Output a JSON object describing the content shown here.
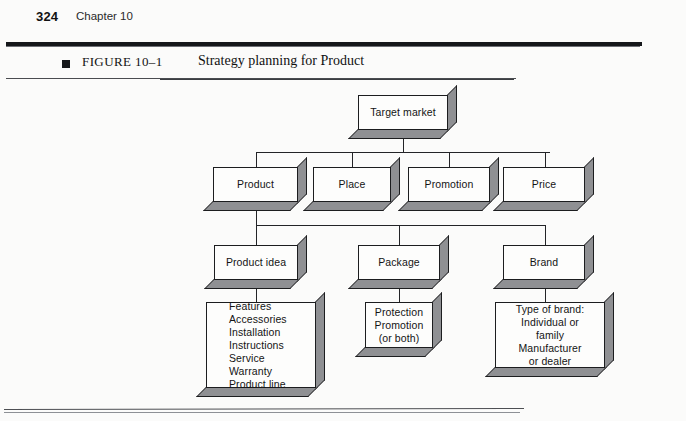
{
  "page": {
    "number": "324",
    "chapter": "Chapter 10",
    "background_color": "#fbfbfa",
    "rule_color": "#15171a"
  },
  "figure": {
    "bullet": "square-bullet-icon",
    "number": "FIGURE 10–1",
    "title": "Strategy planning for Product"
  },
  "diagram": {
    "type": "hierarchy-tree",
    "box_face_color": "#fdfdfc",
    "box_shadow_color": "#8f9093",
    "box_outline_color": "#1c1d1f",
    "levels": [
      {
        "level": 1,
        "nodes": [
          {
            "id": "target-market",
            "label": "Target market"
          }
        ]
      },
      {
        "level": 2,
        "nodes": [
          {
            "id": "product",
            "label": "Product"
          },
          {
            "id": "place",
            "label": "Place"
          },
          {
            "id": "promotion",
            "label": "Promotion"
          },
          {
            "id": "price",
            "label": "Price"
          }
        ]
      },
      {
        "level": 3,
        "nodes": [
          {
            "id": "product-idea",
            "label": "Product idea"
          },
          {
            "id": "package",
            "label": "Package"
          },
          {
            "id": "brand",
            "label": "Brand"
          }
        ]
      },
      {
        "level": 4,
        "nodes": [
          {
            "id": "product-features",
            "lines": [
              "Features",
              "Accessories",
              "Installation",
              "Instructions",
              "Service",
              "Warranty",
              "Product line"
            ]
          },
          {
            "id": "package-purpose",
            "lines": [
              "Protection",
              "Promotion",
              "(or both)"
            ]
          },
          {
            "id": "brand-type",
            "lines": [
              "Type of brand:",
              "Individual or",
              "family",
              "Manufacturer",
              "or dealer"
            ]
          }
        ]
      }
    ]
  }
}
